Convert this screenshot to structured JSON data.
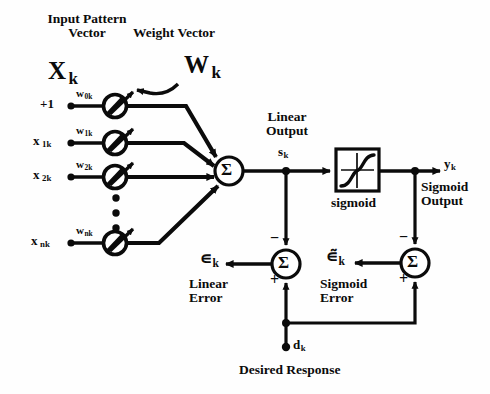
{
  "diagram": {
    "colors": {
      "ink": "#0b0b0b",
      "background": "#ffffff"
    },
    "labels": {
      "input_pattern_line1": "Input Pattern",
      "input_pattern_line2": "Vector",
      "input_vector_symbol": "X",
      "input_vector_subscript": "k",
      "weight_vector_caption": "Weight Vector",
      "weight_vector_symbol": "W",
      "weight_vector_subscript": "k",
      "linear_output_line1": "Linear",
      "linear_output_line2": "Output",
      "linear_output_symbol": "s",
      "linear_output_subscript": "k",
      "sigmoid_box_caption": "sigmoid",
      "sigmoid_output_symbol": "y",
      "sigmoid_output_subscript": "k",
      "sigmoid_output_line1": "Sigmoid",
      "sigmoid_output_line2": "Output",
      "linear_error_symbol": "∊",
      "linear_error_subscript": "k",
      "linear_error_line1": "Linear",
      "linear_error_line2": "Error",
      "sigmoid_error_symbol": "∊̃",
      "sigmoid_error_subscript": "k",
      "sigmoid_error_line1": "Sigmoid",
      "sigmoid_error_line2": "Error",
      "desired_symbol": "d",
      "desired_subscript": "k",
      "desired_caption": "Desired Response",
      "summer_glyph": "Σ",
      "plus_sign": "+",
      "minus_sign": "−"
    },
    "inputs": [
      {
        "name": "bias",
        "signal": "+1",
        "signal_sub": "",
        "weight": "w",
        "weight_sub": "0k"
      },
      {
        "name": "x1",
        "signal": "x",
        "signal_sub": "1k",
        "weight": "w",
        "weight_sub": "1k"
      },
      {
        "name": "x2",
        "signal": "x",
        "signal_sub": "2k",
        "weight": "w",
        "weight_sub": "2k"
      },
      {
        "name": "xn",
        "signal": "x",
        "signal_sub": "nk",
        "weight": "w",
        "weight_sub": "nk"
      }
    ],
    "ellipsis_dots": 3
  }
}
